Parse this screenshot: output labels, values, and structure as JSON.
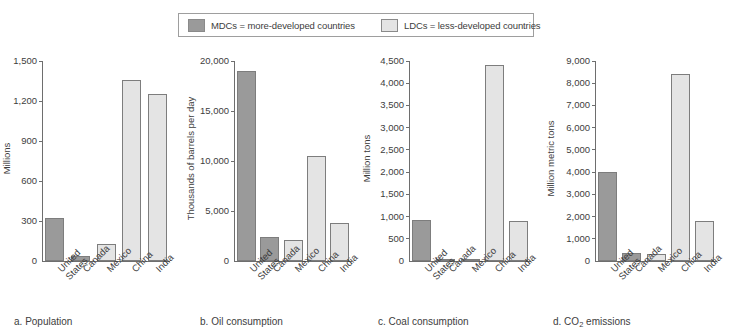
{
  "legend": {
    "entries": [
      {
        "key": "mdc",
        "label": "MDCs = more-developed countries",
        "color": "#9a9a9a"
      },
      {
        "key": "ldc",
        "label": "LDCs = less-developed countries",
        "color": "#e4e4e4"
      }
    ]
  },
  "chart_data": [
    {
      "id": "a",
      "type": "bar",
      "title": "a. Population",
      "caption_prefix": "a. ",
      "caption_main": "Population",
      "xlabel": "",
      "ylabel": "Millions",
      "ylim": [
        0,
        1500
      ],
      "yticks": [
        0,
        300,
        600,
        900,
        1200,
        1500
      ],
      "ytick_labels": [
        "0",
        "300",
        "600",
        "900",
        "1,200",
        "1,500"
      ],
      "grid": false,
      "categories": [
        "United\nStates",
        "Canada",
        "Mexico",
        "China",
        "India"
      ],
      "values": [
        320,
        35,
        130,
        1360,
        1250
      ],
      "groups": [
        "mdc",
        "mdc",
        "ldc",
        "ldc",
        "ldc"
      ]
    },
    {
      "id": "b",
      "type": "bar",
      "title": "b. Oil consumption",
      "caption_prefix": "b. ",
      "caption_main": "Oil consumption",
      "xlabel": "",
      "ylabel": "Thousands of barrels per day",
      "ylim": [
        0,
        20000
      ],
      "yticks": [
        0,
        5000,
        10000,
        15000,
        20000
      ],
      "ytick_labels": [
        "0",
        "5,000",
        "10,000",
        "15,000",
        "20,000"
      ],
      "grid": false,
      "categories": [
        "United\nStates",
        "Canada",
        "Mexico",
        "China",
        "India"
      ],
      "values": [
        19000,
        2400,
        2150,
        10500,
        3800
      ],
      "groups": [
        "mdc",
        "mdc",
        "ldc",
        "ldc",
        "ldc"
      ]
    },
    {
      "id": "c",
      "type": "bar",
      "title": "c. Coal consumption",
      "caption_prefix": "c. ",
      "caption_main": "Coal consumption",
      "xlabel": "",
      "ylabel": "Million tons",
      "ylim": [
        0,
        4500
      ],
      "yticks": [
        0,
        500,
        1000,
        1500,
        2000,
        2500,
        3000,
        3500,
        4000,
        4500
      ],
      "ytick_labels": [
        "0",
        "500",
        "1,000",
        "1,500",
        "2,000",
        "2,500",
        "3,000",
        "3,500",
        "4,000",
        "4,500"
      ],
      "grid": false,
      "categories": [
        "United\nStates",
        "Canada",
        "Mexico",
        "China",
        "India"
      ],
      "values": [
        930,
        50,
        30,
        4400,
        900
      ],
      "groups": [
        "mdc",
        "mdc",
        "ldc",
        "ldc",
        "ldc"
      ]
    },
    {
      "id": "d",
      "type": "bar",
      "title": "d. CO2 emissions",
      "caption_prefix": "d. CO",
      "caption_sub": "2",
      "caption_main": " emissions",
      "xlabel": "",
      "ylabel": "Million metric tons",
      "ylim": [
        0,
        9000
      ],
      "yticks": [
        0,
        1000,
        2000,
        3000,
        4000,
        5000,
        6000,
        7000,
        8000,
        9000
      ],
      "ytick_labels": [
        "0",
        "1,000",
        "2,000",
        "3,000",
        "4,000",
        "5,000",
        "6,000",
        "7,000",
        "8,000",
        "9,000"
      ],
      "grid": false,
      "categories": [
        "United\nStates",
        "Canada",
        "Mexico",
        "China",
        "India"
      ],
      "values": [
        4000,
        370,
        330,
        8400,
        1800
      ],
      "groups": [
        "mdc",
        "mdc",
        "ldc",
        "ldc",
        "ldc"
      ]
    }
  ]
}
